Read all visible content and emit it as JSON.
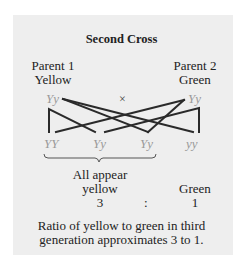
{
  "title": "Second Cross",
  "parents": [
    {
      "label": "Parent 1",
      "phenotype": "Yellow",
      "genotype": "Yy"
    },
    {
      "label": "Parent 2",
      "phenotype": "Green",
      "genotype": "Yy"
    }
  ],
  "cross_symbol": "×",
  "offspring": [
    "YY",
    "Yy",
    "Yy",
    "yy"
  ],
  "groups": {
    "yellow_label_1": "All appear",
    "yellow_label_2": "yellow",
    "yellow_count": "3",
    "separator": ":",
    "green_label": "Green",
    "green_count": "1"
  },
  "caption_1": "Ratio of yellow to green in third",
  "caption_2": "generation approximates 3 to 1.",
  "colors": {
    "background": "#eeeeee",
    "genotype": "#9a9a9a",
    "lines": "#2a2a2a"
  }
}
